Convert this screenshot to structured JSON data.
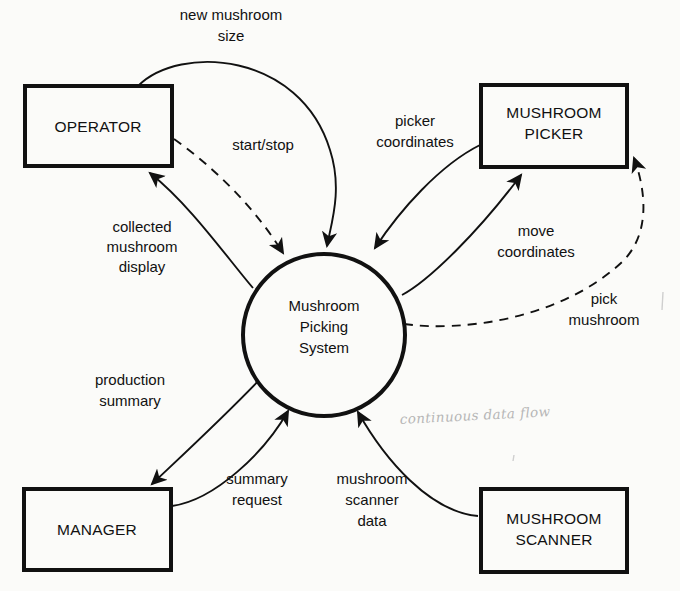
{
  "diagram": {
    "type": "data-flow-diagram",
    "background_color": "#fbfbf9",
    "ink_color": "#111111",
    "annotation_color": "#b6b6b6"
  },
  "process": {
    "name": "Mushroom Picking System",
    "line1": "Mushroom",
    "line2": "Picking",
    "line3": "System"
  },
  "entities": [
    {
      "id": "operator",
      "line1": "OPERATOR",
      "line2": ""
    },
    {
      "id": "mushroom_picker",
      "line1": "MUSHROOM",
      "line2": "PICKER"
    },
    {
      "id": "manager",
      "line1": "MANAGER",
      "line2": ""
    },
    {
      "id": "mushroom_scanner",
      "line1": "MUSHROOM",
      "line2": "SCANNER"
    }
  ],
  "flows": [
    {
      "id": "new_mushroom_size",
      "line1": "new mushroom",
      "line2": "size",
      "from": "operator",
      "to": "process",
      "style": "solid"
    },
    {
      "id": "start_stop",
      "line1": "start/stop",
      "line2": "",
      "from": "operator",
      "to": "process",
      "style": "dashed"
    },
    {
      "id": "collected_mushroom_display",
      "line1": "collected",
      "line2": "mushroom",
      "line3": "display",
      "from": "process",
      "to": "operator",
      "style": "solid"
    },
    {
      "id": "picker_coordinates",
      "line1": "picker",
      "line2": "coordinates",
      "from": "mushroom_picker",
      "to": "process",
      "style": "solid"
    },
    {
      "id": "move_coordinates",
      "line1": "move",
      "line2": "coordinates",
      "from": "process",
      "to": "mushroom_picker",
      "style": "solid"
    },
    {
      "id": "pick_mushroom",
      "line1": "pick",
      "line2": "mushroom",
      "from": "process",
      "to": "mushroom_picker",
      "style": "dashed"
    },
    {
      "id": "production_summary",
      "line1": "production",
      "line2": "summary",
      "from": "process",
      "to": "manager",
      "style": "solid"
    },
    {
      "id": "summary_request",
      "line1": "summary",
      "line2": "request",
      "from": "manager",
      "to": "process",
      "style": "solid"
    },
    {
      "id": "mushroom_scanner_data",
      "line1": "mushroom",
      "line2": "scanner",
      "line3": "data",
      "from": "mushroom_scanner",
      "to": "process",
      "style": "solid"
    }
  ],
  "annotations": [
    {
      "id": "continuous_data_flow",
      "text": "continuous data flow",
      "handwritten": true
    }
  ]
}
